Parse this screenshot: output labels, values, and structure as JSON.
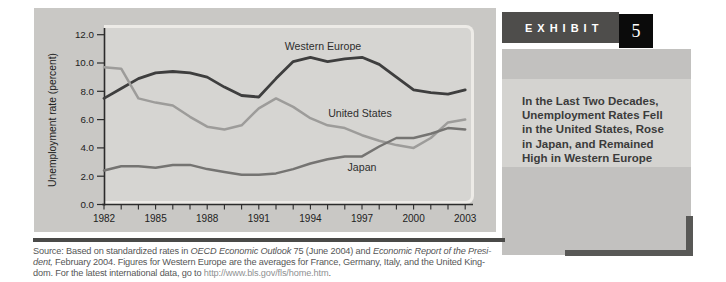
{
  "sidebar": {
    "exhibit_label": "EXHIBIT",
    "exhibit_number": "5",
    "caption_lines": [
      "In the Last Two Decades,",
      "Unemployment Rates Fell",
      "in the United States, Rose",
      "in Japan, and Remained",
      "High in Western Europe"
    ]
  },
  "source_note": {
    "lines": [
      [
        {
          "text": "Source: Based on standardized rates in ",
          "style": "normal"
        },
        {
          "text": "OECD Economic Outlook",
          "style": "italic"
        },
        {
          "text": " 75 (June 2004) and ",
          "style": "normal"
        },
        {
          "text": "Economic Report of the Presi-",
          "style": "italic"
        }
      ],
      [
        {
          "text": "dent,",
          "style": "italic"
        },
        {
          "text": " February 2004. Figures for Western Europe are the averages for France, Germany, Italy, and the United King-",
          "style": "normal"
        }
      ],
      [
        {
          "text": "dom. For the latest international data, go to ",
          "style": "normal"
        },
        {
          "text": "http://www.bls.gov/fls/home.htm",
          "style": "url"
        },
        {
          "text": ".",
          "style": "normal"
        }
      ]
    ]
  },
  "chart_data": {
    "type": "line",
    "title": "",
    "xlabel": "",
    "ylabel": "Unemployment rate (percent)",
    "ylim": [
      0,
      12
    ],
    "y_ticks": [
      0,
      2,
      4,
      6,
      8,
      10,
      12
    ],
    "y_tick_labels": [
      "0.0",
      "2.0",
      "4.0",
      "6.0",
      "8.0",
      "10.0",
      "12.0"
    ],
    "x": [
      1982,
      1983,
      1984,
      1985,
      1986,
      1987,
      1988,
      1989,
      1990,
      1991,
      1992,
      1993,
      1994,
      1995,
      1996,
      1997,
      1998,
      1999,
      2000,
      2001,
      2002,
      2003
    ],
    "x_labeled_ticks": [
      1982,
      1985,
      1988,
      1991,
      1994,
      1997,
      2000,
      2003
    ],
    "grid": false,
    "legend": "inline-labels",
    "series": [
      {
        "name": "Western Europe",
        "color": "#3e3e3e",
        "values": [
          7.5,
          8.2,
          8.9,
          9.3,
          9.4,
          9.3,
          9.0,
          8.3,
          7.7,
          7.6,
          8.9,
          10.1,
          10.4,
          10.1,
          10.3,
          10.4,
          9.9,
          9.0,
          8.1,
          7.9,
          7.8,
          8.1
        ]
      },
      {
        "name": "United States",
        "color": "#9d9c9a",
        "values": [
          9.7,
          9.6,
          7.5,
          7.2,
          7.0,
          6.2,
          5.5,
          5.3,
          5.6,
          6.8,
          7.5,
          6.9,
          6.1,
          5.6,
          5.4,
          4.9,
          4.5,
          4.2,
          4.0,
          4.7,
          5.8,
          6.0
        ]
      },
      {
        "name": "Japan",
        "color": "#757472",
        "values": [
          2.4,
          2.7,
          2.7,
          2.6,
          2.8,
          2.8,
          2.5,
          2.3,
          2.1,
          2.1,
          2.2,
          2.5,
          2.9,
          3.2,
          3.4,
          3.4,
          4.1,
          4.7,
          4.7,
          5.0,
          5.4,
          5.3
        ]
      }
    ],
    "label_positions": {
      "Western Europe": [
        289,
        42
      ],
      "United States": [
        326,
        109
      ],
      "Japan": [
        328,
        163
      ]
    }
  },
  "colors": {
    "panel_bg": "#c9c8c5",
    "plot_bg": "#d6d5d2",
    "bevel": "#edebe7",
    "axis": "#2b2b2b",
    "exhibit_bar": "#4e4d4b",
    "number_box": "#0b0b0b",
    "sidebar_block": "#c2c1bf",
    "caption_bg": "#d4d3d0",
    "divider": "#4a4a48",
    "source_text": "#565656",
    "url_text": "#8f9192"
  }
}
